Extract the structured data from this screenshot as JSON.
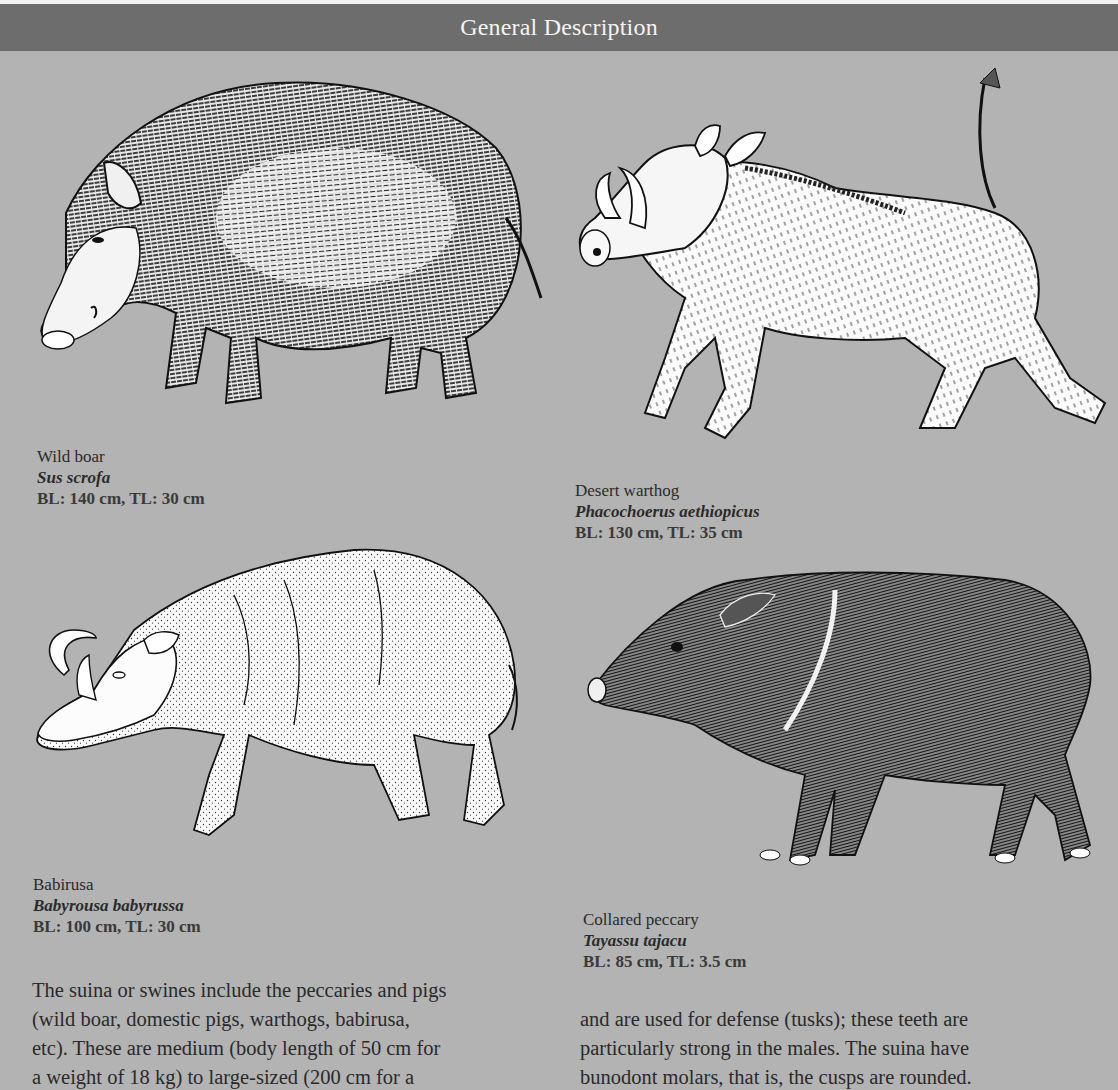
{
  "header": {
    "title": "General Description"
  },
  "animals": [
    {
      "common_name": "Wild boar",
      "scientific_name": "Sus scrofa",
      "dimensions": "BL: 140 cm, TL: 30 cm",
      "illustration": "wild-boar-illustration"
    },
    {
      "common_name": "Desert warthog",
      "scientific_name": "Phacochoerus aethiopicus",
      "dimensions": "BL: 130 cm, TL: 35 cm",
      "illustration": "desert-warthog-illustration"
    },
    {
      "common_name": "Babirusa",
      "scientific_name": "Babyrousa babyrussa",
      "dimensions": "BL: 100 cm, TL: 30 cm",
      "illustration": "babirusa-illustration"
    },
    {
      "common_name": "Collared peccary",
      "scientific_name": "Tayassu tajacu",
      "dimensions": "BL: 85 cm, TL: 3.5 cm",
      "illustration": "collared-peccary-illustration"
    }
  ],
  "body": {
    "left_column": [
      "The suina or swines include the peccaries and pigs",
      "(wild boar, domestic pigs, warthogs, babirusa,",
      "etc). These are medium (body length of 50 cm for",
      "a weight of 18 kg) to large-sized (200 cm for a"
    ],
    "right_column": [
      "and are used for defense (tusks); these teeth are",
      "particularly strong in the males. The suina have",
      "bunodont molars, that is, the cusps are rounded."
    ]
  },
  "colors": {
    "page_background": "#b3b3b3",
    "header_band": "#6d6d6d",
    "header_text": "#f4f4f4",
    "ink": "#1a1a1a"
  }
}
